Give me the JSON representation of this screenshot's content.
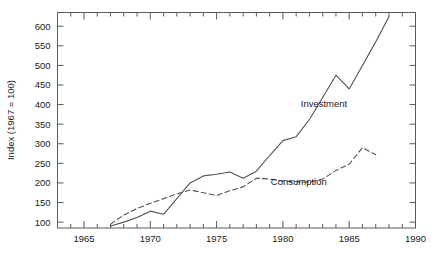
{
  "chart_data": {
    "type": "line",
    "title": "",
    "xlabel": "",
    "ylabel": "Index (1967 = 100)",
    "xlim": [
      1963,
      1990
    ],
    "ylim": [
      85,
      635
    ],
    "yticks": [
      100,
      150,
      200,
      250,
      300,
      350,
      400,
      450,
      500,
      550,
      600
    ],
    "ytick_labels": [
      "100",
      "150",
      "200",
      "250",
      "300",
      "350",
      "400",
      "450",
      "500",
      "550",
      "600"
    ],
    "xticks": [
      1965,
      1970,
      1975,
      1980,
      1985,
      1990
    ],
    "xtick_labels": [
      "1965",
      "1970",
      "1975",
      "1980",
      "1985",
      "1990"
    ],
    "x_minor_tick_step": 1,
    "grid": false,
    "legend": "inline-annotations",
    "series": [
      {
        "name": "Investment",
        "style": "solid",
        "color": "#4d5256",
        "label_x": 1983.1,
        "label_y": 395,
        "x": [
          1967,
          1968,
          1969,
          1970,
          1971,
          1972,
          1973,
          1974,
          1975,
          1976,
          1977,
          1978,
          1979,
          1980,
          1981,
          1982,
          1983,
          1984,
          1985,
          1986,
          1987,
          1988
        ],
        "y": [
          90,
          100,
          112,
          128,
          120,
          160,
          200,
          218,
          222,
          228,
          212,
          230,
          270,
          308,
          318,
          362,
          418,
          475,
          440,
          500,
          560,
          625
        ]
      },
      {
        "name": "Consumption",
        "style": "dashed",
        "color": "#4d5256",
        "label_x": 1981.2,
        "label_y": 196,
        "x": [
          1967,
          1968,
          1969,
          1970,
          1971,
          1972,
          1973,
          1974,
          1975,
          1976,
          1977,
          1978,
          1979,
          1980,
          1981,
          1982,
          1983,
          1984,
          1985,
          1986,
          1987
        ],
        "y": [
          95,
          118,
          135,
          148,
          160,
          172,
          182,
          175,
          168,
          180,
          190,
          212,
          210,
          205,
          203,
          202,
          210,
          232,
          248,
          290,
          272
        ]
      }
    ]
  }
}
